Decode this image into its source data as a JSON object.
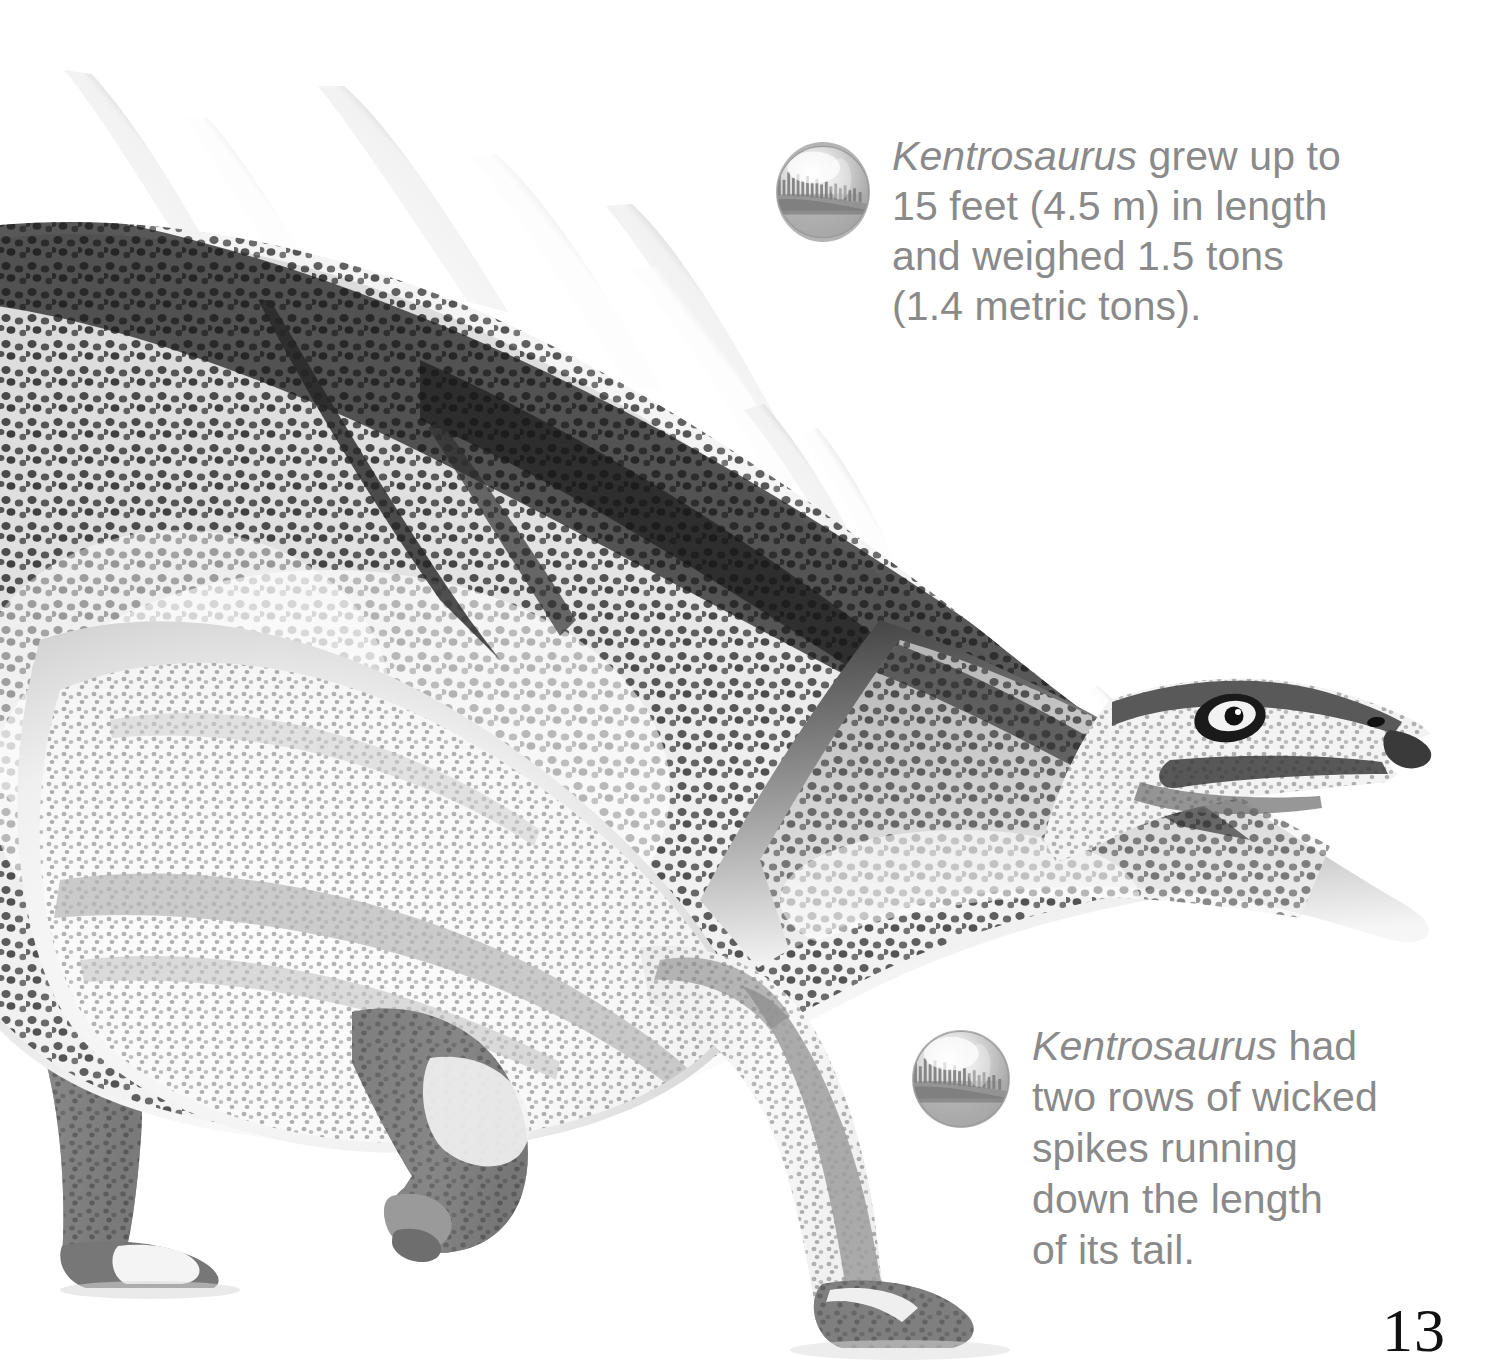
{
  "page": {
    "number": "13",
    "background_color": "#ffffff",
    "subject": "Kentrosaurus"
  },
  "illustration": {
    "name": "kentrosaurus-illustration",
    "description": "Black and white illustration of a Kentrosaurus dinosaur walking, shown in profile facing right, with two rows of long tapered spikes running along its back and tail and a pebbled reticulated skin texture.",
    "palette": {
      "skin_dark": "#3a3a3a",
      "skin_mid": "#7c7c7c",
      "skin_light": "#e9e9e9",
      "spike_light": "#ffffff",
      "spike_dark": "#2b2b2b",
      "outline": "#1f1f1f"
    }
  },
  "captions": [
    {
      "id": "caption-length",
      "bullet_icon": "sphere-landscape-icon",
      "genus": "Kentrosaurus",
      "lines": [
        " grew up to",
        "15 feet (4.5 m) in length",
        "and weighed 1.5 tons",
        "(1.4 metric tons)."
      ],
      "text_color": "#8a8a8a"
    },
    {
      "id": "caption-spikes",
      "bullet_icon": "sphere-landscape-icon",
      "genus": "Kentrosaurus",
      "lines": [
        " had",
        "two rows of wicked",
        "spikes running",
        "down the length",
        "of its tail."
      ],
      "text_color": "#8a8a8a"
    }
  ]
}
